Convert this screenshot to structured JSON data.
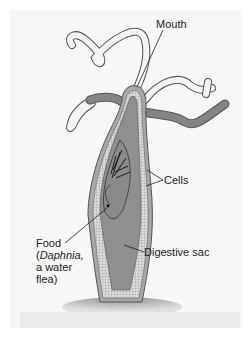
{
  "diagram": {
    "labels": {
      "mouth": "Mouth",
      "cells": "Cells",
      "food_line1": "Food",
      "food_paren_open": "(",
      "food_species": "Daphnia,",
      "food_line3": "a water",
      "food_line4": "flea)",
      "digestive_sac": "Digestive sac"
    },
    "colors": {
      "background": "#f7f7f7",
      "body_wall": "#a8a8a8",
      "cell_layer": "#d8d8d8",
      "digestive_sac": "#8f8f8f",
      "tentacle_fill": "#f4f4f4",
      "outline": "#555555",
      "base": "#9a9a9a"
    }
  }
}
